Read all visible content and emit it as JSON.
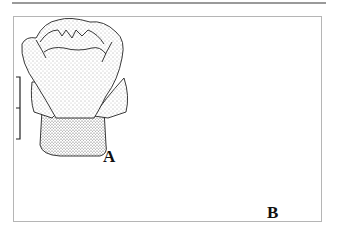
{
  "figure": {
    "panels": [
      {
        "id": "A",
        "label": "A",
        "subject": "flower bud / calyx, external view, stippled"
      },
      {
        "id": "B",
        "label": "B",
        "subject": "dissected flower showing stamens, style with bilobed stigma, petals"
      }
    ],
    "scale_bars": [
      {
        "panel": "A",
        "orientation": "vertical",
        "ticks": 3
      },
      {
        "panel": "B",
        "orientation": "vertical",
        "ticks": 2
      }
    ],
    "colors": {
      "ink": "#222222",
      "frame": "#b5b5b5",
      "rule": "#9a9a9a",
      "background": "#ffffff"
    }
  }
}
